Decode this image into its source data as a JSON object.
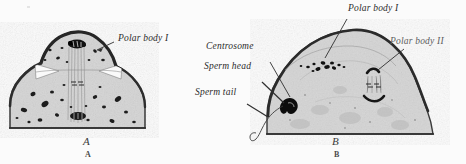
{
  "figure": {
    "kind": "histology-plate",
    "background_color": "#fbfbfb",
    "cytoplasm_color": "#d4d4d4",
    "outline_color": "#2f2f2f",
    "granule_color": "#1a1a1a",
    "panels": [
      {
        "id": "A",
        "caption": "A",
        "caption_sub": "A",
        "labels": [
          {
            "name": "polar-body-1",
            "text": "Polar body I"
          }
        ]
      },
      {
        "id": "B",
        "caption": "B",
        "caption_sub": "B",
        "labels": [
          {
            "name": "polar-body-1",
            "text": "Polar body I"
          },
          {
            "name": "polar-body-2",
            "text": "Polar body II"
          },
          {
            "name": "centrosome",
            "text": "Centrosome"
          },
          {
            "name": "sperm-head",
            "text": "Sperm head"
          },
          {
            "name": "sperm-tail",
            "text": "Sperm tail"
          }
        ]
      }
    ]
  }
}
